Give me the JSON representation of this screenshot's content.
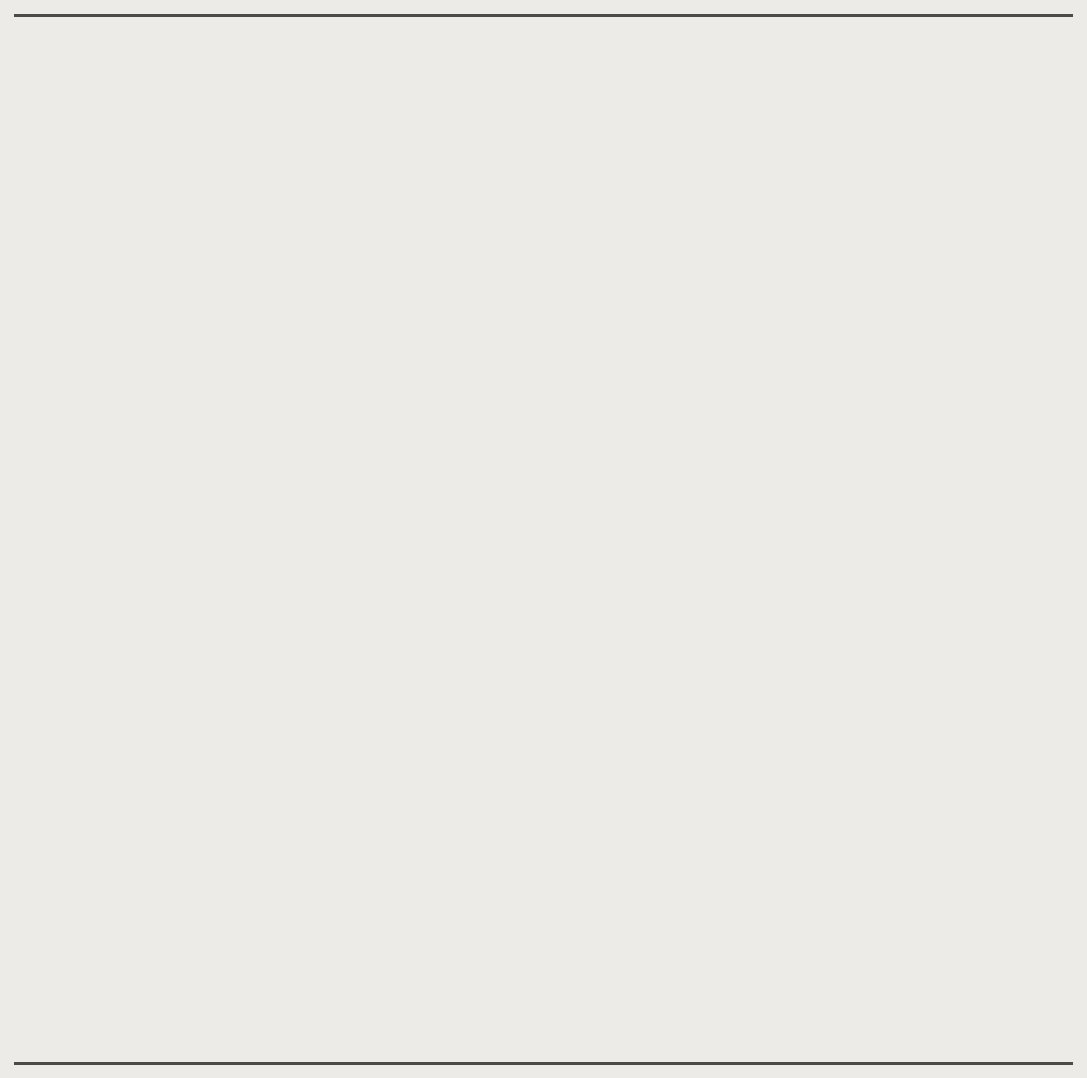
{
  "figure": {
    "accent_fill": "#dedede",
    "accent_line": "#a9a9a9",
    "axis_color": "#1a1a1a",
    "page_background": "#edebe8"
  },
  "chart_data": [
    {
      "type": "area",
      "id": "current-account",
      "title": "A Current Account Deficit Erodes the Net Investment Position",
      "annotation": "Balance on current account",
      "xlabel": "",
      "ylabel": "Percent of nominal GDP",
      "xlim": [
        1975,
        2006
      ],
      "ylim": [
        -7,
        2
      ],
      "yticks": [
        2,
        1,
        0,
        -1,
        -2,
        -3,
        -4,
        -5,
        -6,
        -7
      ],
      "ytick_labels": [
        "2",
        "1",
        "0",
        "−1",
        "−2",
        "−3",
        "−4",
        "−5",
        "−6",
        "−7"
      ],
      "xticks": [
        1975,
        1980,
        1985,
        1990,
        1995,
        2000,
        2005
      ],
      "xtick_labels": [
        "1975",
        "1980",
        "1985",
        "1990",
        "1995",
        "2000",
        "2005"
      ],
      "minor_xtick_interval": 1,
      "grid": false,
      "legend": "none",
      "baseline": 0,
      "x": [
        1975,
        1976,
        1977,
        1978,
        1979,
        1980,
        1981,
        1982,
        1983,
        1984,
        1985,
        1986,
        1987,
        1988,
        1989,
        1990,
        1991,
        1992,
        1993,
        1994,
        1995,
        1996,
        1997,
        1998,
        1999,
        2000,
        2001,
        2002,
        2003,
        2004,
        2005,
        2006
      ],
      "values": [
        1.2,
        0.2,
        -0.5,
        -0.5,
        0.25,
        0.4,
        0.2,
        -0.1,
        -1.05,
        -2.25,
        -2.8,
        -3.2,
        -3.2,
        -2.3,
        -1.75,
        -1.2,
        0.25,
        -0.75,
        -1.2,
        -1.5,
        -1.25,
        -1.3,
        -1.35,
        -2.2,
        -3.1,
        -4.05,
        -3.65,
        -4.35,
        -4.6,
        -5.4,
        -5.95,
        -6.0
      ]
    },
    {
      "type": "area",
      "id": "net-international-investment-position",
      "title": "",
      "annotation": "Net international investment position",
      "xlabel": "",
      "ylabel": "Percent of nominal GDP",
      "xlim": [
        1975,
        2006
      ],
      "ylim": [
        -25,
        15
      ],
      "yticks": [
        15,
        10,
        5,
        0,
        -5,
        -10,
        -15,
        -20,
        -25
      ],
      "ytick_labels": [
        "15",
        "10",
        "5",
        "0",
        "−5",
        "−10",
        "−15",
        "−20",
        "−25"
      ],
      "xticks": [
        1975,
        1980,
        1985,
        1990,
        1995,
        2000,
        2005
      ],
      "xtick_labels": [
        "1975",
        "1980",
        "1985",
        "1990",
        "1995",
        "2000",
        "2005"
      ],
      "minor_xtick_interval": 1,
      "grid": false,
      "legend": "none",
      "baseline": 0,
      "x": [
        1975,
        1976,
        1977,
        1978,
        1979,
        1980,
        1981,
        1982,
        1983,
        1984,
        1985,
        1986,
        1987,
        1988,
        1989,
        1990,
        1991,
        1992,
        1993,
        1994,
        1995,
        1996,
        1997,
        1998,
        1999,
        2000,
        2001,
        2002,
        2003,
        2004,
        2005,
        2006
      ],
      "values": [
        8.7,
        8.8,
        8.2,
        8.7,
        12.2,
        13.0,
        12.2,
        11.2,
        10.4,
        7.3,
        2.6,
        -0.6,
        -2.0,
        -3.5,
        -4.6,
        -4.4,
        -5.2,
        -6.9,
        -4.6,
        -4.5,
        -5.3,
        -5.6,
        -7.4,
        -9.9,
        -8.3,
        -14.0,
        -19.0,
        -20.0,
        -20.1,
        -19.9,
        -18.3,
        -19.3
      ]
    }
  ],
  "annotations": {
    "current_account_label": "Balance on current account",
    "niip_label_line1": "Net international investment",
    "niip_label_line2": "position"
  },
  "axis_titles": {
    "top_y": "Percent of nominal GDP",
    "bottom_y": "Percent of nominal GDP"
  }
}
